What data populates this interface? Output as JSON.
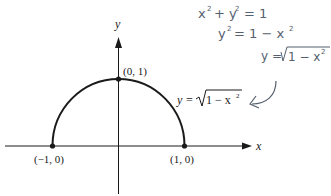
{
  "diagram": {
    "axes": {
      "x_label": "x",
      "y_label": "y"
    },
    "points": [
      {
        "label": "(−1, 0)",
        "x": -1,
        "y": 0
      },
      {
        "label": "(0, 1)",
        "x": 0,
        "y": 1
      },
      {
        "label": "(1, 0)",
        "x": 1,
        "y": 0
      }
    ],
    "curve_label": "y = √(1 − x²)",
    "curve_label_parts": {
      "lhs": "y =",
      "radicand": "1 − x",
      "exp": "2"
    },
    "handwritten_notes": [
      "x² + y² = 1",
      "y² = 1 − x²",
      "y = √(1 − x²)"
    ],
    "handwritten_parts": {
      "line1": {
        "a": "x",
        "b": "+ y",
        "c": "= 1"
      },
      "line2": {
        "a": "y",
        "b": "= 1 − x"
      },
      "line3": {
        "a": "y =",
        "b": "1 − x"
      }
    },
    "colors": {
      "ink": "#1a1a1a",
      "pencil": "#55606e"
    }
  }
}
